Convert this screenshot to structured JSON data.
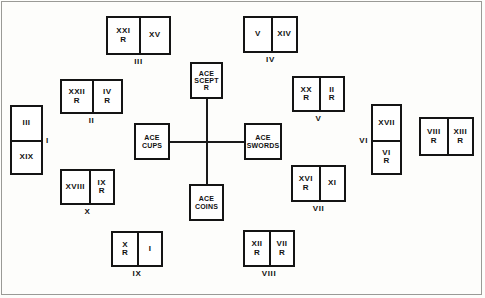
{
  "diagram": {
    "ink_color": "#141414",
    "background_color": "#fdfdfb"
  },
  "center_cross": {
    "ace_sceptre": {
      "rank": "ACE",
      "suit": "SCEPT",
      "reversed": "R"
    },
    "ace_cups": {
      "rank": "ACE",
      "suit": "CUPS",
      "reversed": ""
    },
    "ace_swords": {
      "rank": "ACE",
      "suit": "SWORDS",
      "reversed": ""
    },
    "ace_coins": {
      "rank": "ACE",
      "suit": "COINS",
      "reversed": ""
    }
  },
  "groups": {
    "g1": {
      "number": "I",
      "cards": [
        {
          "rank": "III",
          "rev": ""
        },
        {
          "rank": "XIX",
          "rev": ""
        }
      ]
    },
    "g2": {
      "number": "II",
      "cards": [
        {
          "rank": "XXII",
          "rev": "R"
        },
        {
          "rank": "IV",
          "rev": "R"
        }
      ]
    },
    "g3": {
      "number": "III",
      "cards": [
        {
          "rank": "XXI",
          "rev": "R"
        },
        {
          "rank": "XV",
          "rev": ""
        }
      ]
    },
    "g4": {
      "number": "IV",
      "cards": [
        {
          "rank": "V",
          "rev": ""
        },
        {
          "rank": "XIV",
          "rev": ""
        }
      ]
    },
    "g5": {
      "number": "V",
      "cards": [
        {
          "rank": "XX",
          "rev": "R"
        },
        {
          "rank": "II",
          "rev": "R"
        }
      ]
    },
    "g6": {
      "number": "VI",
      "cards": [
        {
          "rank": "XVII",
          "rev": ""
        },
        {
          "rank": "VI",
          "rev": "R"
        }
      ]
    },
    "g7": {
      "number": "VII",
      "cards": [
        {
          "rank": "XVI",
          "rev": "R"
        },
        {
          "rank": "XI",
          "rev": ""
        }
      ]
    },
    "g8": {
      "number": "VIII",
      "cards": [
        {
          "rank": "XII",
          "rev": "R"
        },
        {
          "rank": "VII",
          "rev": "R"
        }
      ]
    },
    "g9": {
      "number": "IX",
      "cards": [
        {
          "rank": "X",
          "rev": "R"
        },
        {
          "rank": "I",
          "rev": ""
        }
      ]
    },
    "g10": {
      "number": "X",
      "cards": [
        {
          "rank": "XVIII",
          "rev": ""
        },
        {
          "rank": "IX",
          "rev": "R"
        }
      ]
    },
    "g11": {
      "number": "",
      "cards": [
        {
          "rank": "VIII",
          "rev": "R"
        },
        {
          "rank": "XIII",
          "rev": "R"
        }
      ]
    }
  }
}
